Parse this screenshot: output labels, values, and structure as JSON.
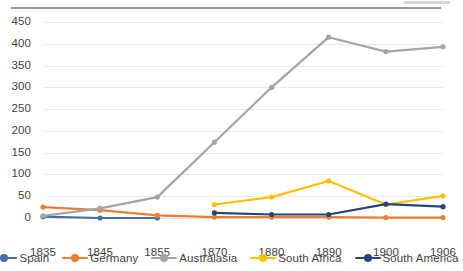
{
  "chart_data": {
    "type": "line",
    "title": "",
    "subtitle": "",
    "xlabel": "",
    "ylabel": "",
    "grid": true,
    "legend_position": "bottom",
    "categories": [
      "1835",
      "1845",
      "1855",
      "1870",
      "1880",
      "1890",
      "1900",
      "1906"
    ],
    "ylim": [
      0,
      450
    ],
    "yticks": [
      "0",
      "50",
      "100",
      "150",
      "200",
      "250",
      "300",
      "350",
      "400",
      "450"
    ],
    "ytick_values": [
      0,
      50,
      100,
      150,
      200,
      250,
      300,
      350,
      400,
      450
    ],
    "series": [
      {
        "name": "Spain",
        "color": "#4472a8",
        "values": [
          3,
          0,
          0,
          null,
          null,
          null,
          null,
          null
        ]
      },
      {
        "name": "Germany",
        "color": "#ed7d31",
        "values": [
          25,
          18,
          6,
          2,
          2,
          2,
          1,
          1
        ]
      },
      {
        "name": "Australasia",
        "color": "#a5a5a5",
        "values": [
          5,
          22,
          48,
          174,
          300,
          415,
          382,
          393
        ]
      },
      {
        "name": "South Africa",
        "color": "#ffc000",
        "values": [
          null,
          null,
          null,
          31,
          48,
          85,
          31,
          51
        ]
      },
      {
        "name": "South America",
        "color": "#264478",
        "values": [
          null,
          null,
          null,
          12,
          8,
          8,
          32,
          26
        ]
      }
    ]
  },
  "legend": {
    "items": [
      {
        "label": "Spain",
        "color": "#4472a8"
      },
      {
        "label": "Germany",
        "color": "#ed7d31"
      },
      {
        "label": "Australasia",
        "color": "#a5a5a5"
      },
      {
        "label": "South Africa",
        "color": "#ffc000"
      },
      {
        "label": "South America",
        "color": "#264478"
      }
    ]
  },
  "axes": {
    "y_ticks": [
      "450",
      "400",
      "350",
      "300",
      "250",
      "200",
      "150",
      "100",
      "50",
      "0"
    ],
    "x_ticks": [
      "1835",
      "1845",
      "1855",
      "1870",
      "1880",
      "1890",
      "1900",
      "1906"
    ]
  }
}
